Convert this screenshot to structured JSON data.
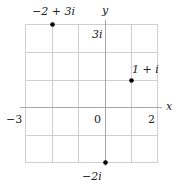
{
  "diagram": {
    "type": "complex-plane",
    "axes": {
      "x_label": "x",
      "y_label": "y"
    },
    "grid": {
      "x_min": -3,
      "x_max": 3,
      "y_min": -2,
      "y_max": 3,
      "step": 1
    },
    "tick_labels": {
      "x_neg": "−3",
      "origin": "0",
      "x_pos": "2",
      "y_top": "3i",
      "y_bottom": "−2i"
    },
    "points": [
      {
        "label": "−2 + 3i",
        "re": -2,
        "im": 3
      },
      {
        "label": "1 + i",
        "re": 1,
        "im": 1
      },
      {
        "label": "−2i",
        "re": 0,
        "im": -2
      }
    ],
    "colors": {
      "grid": "#c8c8c8",
      "axis": "#9a9a9a",
      "point": "#000000",
      "text": "#222222"
    }
  }
}
